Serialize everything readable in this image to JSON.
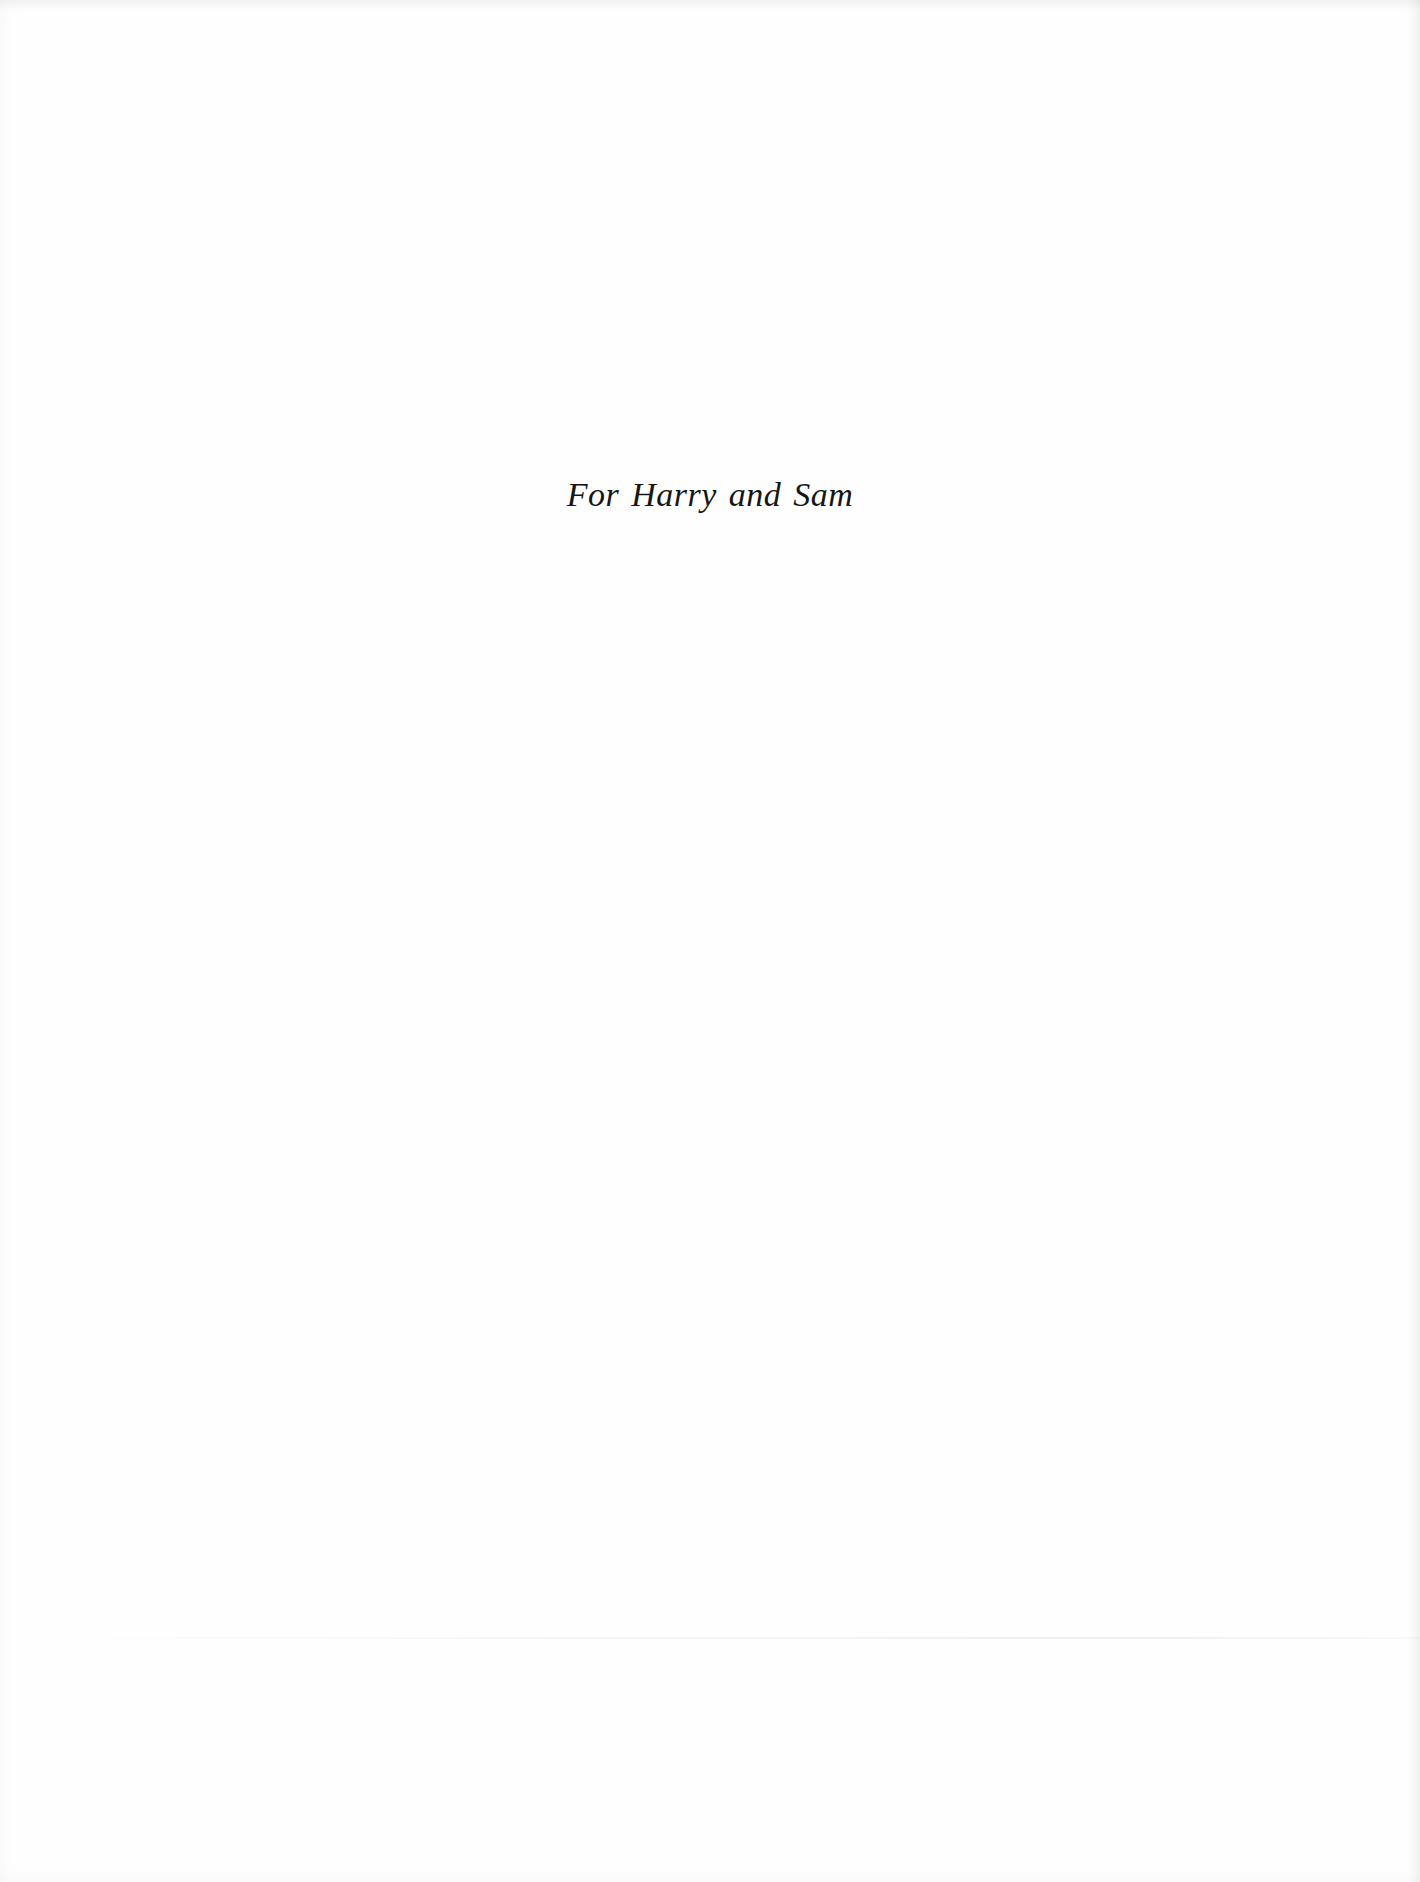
{
  "page": {
    "type": "dedication",
    "background_color": "#fefefe",
    "text_color": "#161616"
  },
  "dedication": {
    "text": "For Harry and Sam"
  }
}
